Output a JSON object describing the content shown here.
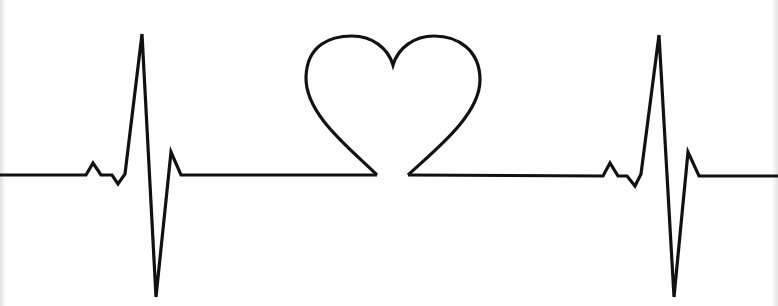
{
  "image": {
    "width": 778,
    "height": 306,
    "background": "#ffffff",
    "stroke_color": "#111111",
    "stroke_width": 3.2,
    "subject": "heartbeat-line-with-heart"
  },
  "paths": {
    "left_ecg": "M 0 175 L 86 175 L 93 163 L 101 175 L 112 175 L 118 184 L 125 174 L 142 34 L 156 297 L 171 152 L 181 175 L 377 175",
    "heart": "M 377 175 C 352 150, 305 115, 306 77 C 307 45, 330 36, 352 36 C 372 36, 388 48, 393 65 C 398 48, 414 36, 434 36 C 458 36, 480 50, 480 80 C 480 115, 435 150, 408 175",
    "right_ecg": "M 408 175 L 603 176 L 610 163 L 618 176 L 627 176 L 635 186 L 641 174 L 659 35 L 674 297 L 688 152 L 699 176 L 778 176"
  }
}
